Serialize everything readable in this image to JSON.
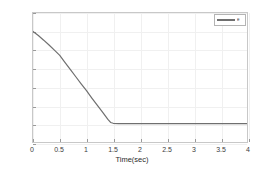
{
  "chart_data": {
    "type": "line",
    "title": "",
    "xlabel": "Time(sec)",
    "ylabel": "",
    "xlim": [
      0,
      4
    ],
    "ylim": [
      -0.2,
      1.2
    ],
    "xticks": [
      "0",
      "0.5",
      "1",
      "1.5",
      "2",
      "2.5",
      "3",
      "3.5",
      "4"
    ],
    "xtick_values": [
      0,
      0.5,
      1,
      1.5,
      2,
      2.5,
      3,
      3.5,
      4
    ],
    "yticks": [
      "1.2",
      "1",
      "0.8",
      "0.6",
      "0.4",
      "0.2",
      "0",
      "-0.2"
    ],
    "ytick_values": [
      1.2,
      1,
      0.8,
      0.6,
      0.4,
      0.2,
      0,
      -0.2
    ],
    "grid": true,
    "legend_position": "top-right",
    "series": [
      {
        "name": "e",
        "color": "#6f6f6f",
        "linewidth": 1.2,
        "x": [
          0,
          0.1,
          0.2,
          0.3,
          0.4,
          0.5,
          0.6,
          0.7,
          0.8,
          0.9,
          1.0,
          1.1,
          1.2,
          1.3,
          1.4,
          1.45,
          1.5,
          1.6,
          1.8,
          2.0,
          2.2,
          2.4,
          2.6,
          2.8,
          3.0,
          3.2,
          3.4,
          3.6,
          3.8,
          4.0
        ],
        "y": [
          1.0,
          0.955,
          0.905,
          0.852,
          0.797,
          0.74,
          0.662,
          0.585,
          0.508,
          0.432,
          0.358,
          0.277,
          0.199,
          0.124,
          0.045,
          0.012,
          0.003,
          0.0,
          0.0,
          0.0,
          0.0,
          0.0,
          0.0,
          0.0,
          0.0,
          0.0,
          0.0,
          0.0,
          0.0,
          0.0
        ]
      }
    ]
  },
  "legend": {
    "entries": [
      {
        "label": "e",
        "color": "#6f6f6f"
      }
    ]
  },
  "axes": {
    "xlabel": "Time(sec)"
  },
  "colors": {
    "curve": "#6f6f6f",
    "grid": "#f0f0f0",
    "frame": "#c8c8c8",
    "text": "#3c3c3c",
    "background": "#ffffff"
  }
}
